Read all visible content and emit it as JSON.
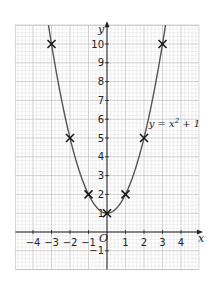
{
  "chart_data": {
    "type": "line",
    "title": "",
    "xlabel": "x",
    "ylabel": "y",
    "origin_label": "O",
    "xlim": [
      -4.95,
      4.97
    ],
    "ylim": [
      -2.0,
      11.0
    ],
    "grid": true,
    "x_ticks": [
      -4,
      -3,
      -2,
      -1,
      1,
      2,
      3,
      4
    ],
    "x_tick_labels": [
      "−4",
      "−3",
      "−2",
      "−1",
      "1",
      "2",
      "3",
      "4"
    ],
    "y_ticks": [
      -1,
      1,
      2,
      3,
      4,
      5,
      6,
      7,
      8,
      9,
      10
    ],
    "y_tick_labels": [
      "−1",
      "1",
      "2",
      "3",
      "4",
      "5",
      "6",
      "7",
      "8",
      "9",
      "10"
    ],
    "series": [
      {
        "name": "y = x² + 1",
        "equation": "y = x^2 + 1",
        "curve_color": "#555555",
        "x_range": [
          -3.2,
          3.2
        ]
      }
    ],
    "points": [
      {
        "x": -3,
        "y": 10
      },
      {
        "x": -2,
        "y": 5
      },
      {
        "x": -1,
        "y": 2
      },
      {
        "x": 0,
        "y": 1
      },
      {
        "x": 1,
        "y": 2
      },
      {
        "x": 2,
        "y": 5
      },
      {
        "x": 3,
        "y": 10
      }
    ],
    "point_marker": "cross",
    "annotation": {
      "text_parts": [
        "y = x",
        "2",
        " + 1"
      ],
      "x": 2.25,
      "y": 5.6
    }
  },
  "colors": {
    "grid_minor": "#d9d9d9",
    "grid_major": "#bdbdbd",
    "axis": "#222222",
    "curve": "#555555",
    "marker": "#111111"
  }
}
